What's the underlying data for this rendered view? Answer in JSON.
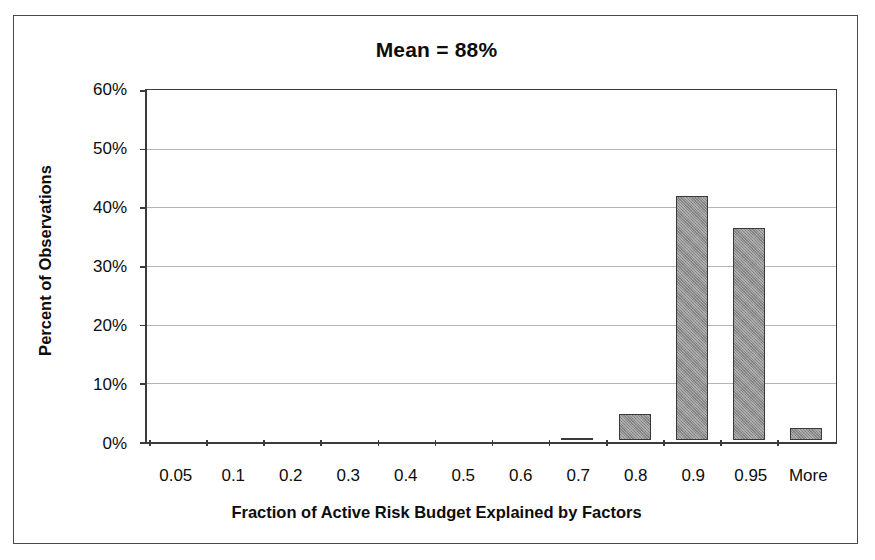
{
  "chart_data": {
    "type": "bar",
    "title": "Mean = 88%",
    "xlabel": "Fraction of Active Risk Budget Explained by Factors",
    "ylabel": "Percent of Observations",
    "categories": [
      "0.05",
      "0.1",
      "0.2",
      "0.3",
      "0.4",
      "0.5",
      "0.6",
      "0.7",
      "0.8",
      "0.9",
      "0.95",
      "More"
    ],
    "values": [
      0,
      0,
      0,
      0,
      0,
      0,
      0,
      0.4,
      4.5,
      42,
      36.5,
      2
    ],
    "value_unit": "%",
    "ylim": [
      0,
      60
    ],
    "ytick_labels": [
      "60%",
      "50%",
      "40%",
      "30%",
      "20%",
      "10%",
      "0%"
    ],
    "ytick_values": [
      60,
      50,
      40,
      30,
      20,
      10,
      0
    ],
    "grid": true,
    "legend": false,
    "bar_color": "#8e8e8e",
    "bar_border_color": "#3a3a3a",
    "axis_color": "#3b3b3b",
    "gridline_color": "#b4b4b4",
    "frame_border_color": "#4a4a4a"
  }
}
